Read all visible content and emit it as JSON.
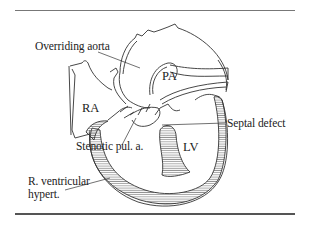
{
  "figure": {
    "labels": {
      "overriding_aorta": "Overriding aorta",
      "pa": "PA",
      "ra": "RA",
      "septal_defect": "Septal defect",
      "stenotic_pul_a": "Stenotic pul. a.",
      "lv": "LV",
      "r_ventricular_line1": "R. ventricular",
      "r_ventricular_line2": "hypert."
    },
    "colors": {
      "line": "#333333",
      "hatch": "#555555",
      "background": "#ffffff"
    }
  }
}
